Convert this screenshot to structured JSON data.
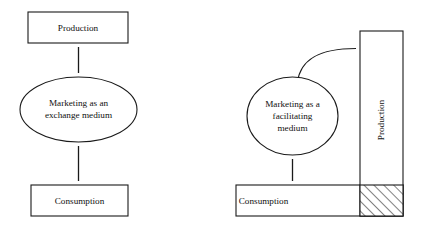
{
  "figure": {
    "background_color": "#ffffff",
    "stroke_color": "#1a1a1a",
    "fill_color": "#ffffff",
    "width": 425,
    "height": 229
  },
  "left_panel": {
    "name": "exchange-medium-model",
    "production": {
      "label": "Production",
      "shape": "rectangle",
      "x": 28,
      "y": 12,
      "width": 100,
      "height": 31
    },
    "center": {
      "label_line1": "Marketing as an",
      "label_line2": "exchange medium",
      "shape": "ellipse",
      "cx": 78.5,
      "cy": 109.5,
      "rx": 58.5,
      "ry": 32.5
    },
    "consumption": {
      "label": "Consumption",
      "shape": "rectangle",
      "x": 31,
      "y": 185,
      "width": 97,
      "height": 31
    },
    "connectors": [
      {
        "name": "production-center-arrow",
        "type": "double-headed-vertical",
        "x": 78.5,
        "y1": 43,
        "y2": 77
      },
      {
        "name": "center-consumption-arrow",
        "type": "double-headed-vertical",
        "x": 78.5,
        "y1": 142,
        "y2": 185
      }
    ]
  },
  "right_panel": {
    "name": "facilitating-medium-model",
    "production": {
      "label": "Production",
      "shape": "vertical-column",
      "text_orientation": "bottom-to-top",
      "x": 360,
      "y": 31,
      "width": 43,
      "height": 185
    },
    "center": {
      "label_line1": "Marketing as a",
      "label_line2": "facilitating",
      "label_line3": "medium",
      "shape": "ellipse",
      "cx": 292.5,
      "cy": 116,
      "rx": 45.5,
      "ry": 39
    },
    "consumption": {
      "label": "Consumption",
      "shape": "horizontal-bar",
      "x": 236,
      "y": 185,
      "width": 167,
      "height": 31
    },
    "overlap_cell": {
      "name": "hatched-overlap",
      "pattern": "diagonal-hatch",
      "x": 360,
      "y": 185,
      "width": 43,
      "height": 31
    },
    "connectors": [
      {
        "name": "center-production-curve",
        "type": "double-headed-curve",
        "from_x": 297,
        "from_y": 78,
        "to_x": 360,
        "to_y": 48
      },
      {
        "name": "center-consumption-arrow",
        "type": "double-headed-vertical",
        "x": 292.5,
        "y1": 155,
        "y2": 185
      }
    ]
  }
}
